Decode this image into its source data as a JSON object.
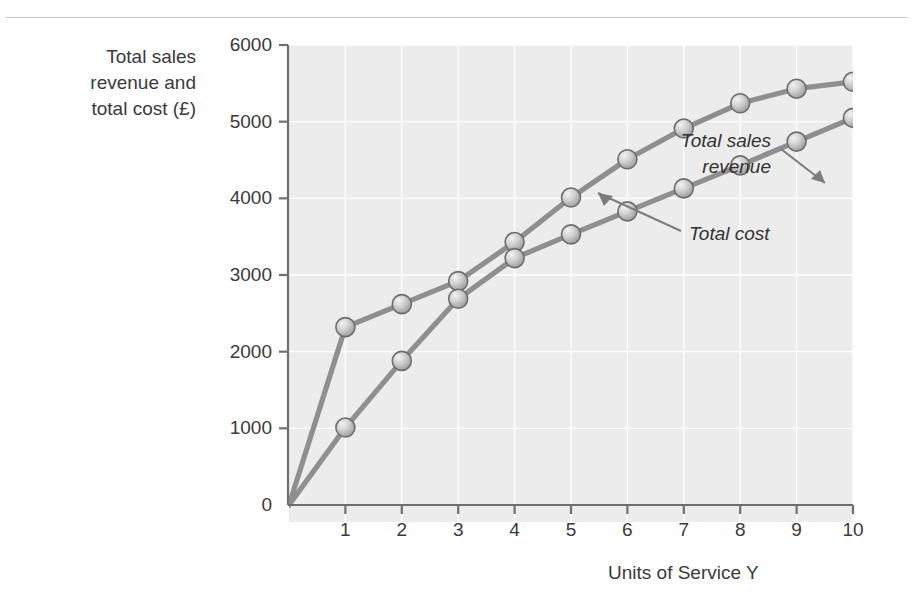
{
  "figure": {
    "y_axis_caption_lines": [
      "Total sales",
      "revenue and",
      "total cost (£)"
    ],
    "x_axis_caption": "Units of Service Y"
  },
  "chart_data": {
    "type": "line",
    "title": "",
    "xlabel": "Units of Service Y",
    "ylabel": "Total sales revenue and total cost (£)",
    "x": [
      0,
      1,
      2,
      3,
      4,
      5,
      6,
      7,
      8,
      9,
      10
    ],
    "xlim": [
      0,
      10
    ],
    "ylim": [
      0,
      6000
    ],
    "xticks": [
      1,
      2,
      3,
      4,
      5,
      6,
      7,
      8,
      9,
      10
    ],
    "xtick_labels": [
      "1",
      "2",
      "3",
      "4",
      "5",
      "6",
      "7",
      "8",
      "9",
      "10"
    ],
    "yticks": [
      0,
      1000,
      2000,
      3000,
      4000,
      5000,
      6000
    ],
    "ytick_labels": [
      "0",
      "1000",
      "2000",
      "3000",
      "4000",
      "5000",
      "6000"
    ],
    "grid": true,
    "legend": "annotations",
    "series": [
      {
        "name": "Total sales revenue",
        "color": "#8f8f8f",
        "marker": "sphere",
        "values": [
          0,
          2320,
          2620,
          2920,
          3430,
          4010,
          4510,
          4910,
          5240,
          5430,
          5520
        ]
      },
      {
        "name": "Total cost",
        "color": "#8f8f8f",
        "marker": "sphere",
        "values": [
          0,
          1010,
          1880,
          2690,
          3220,
          3530,
          3830,
          4130,
          4430,
          4740,
          5050
        ]
      }
    ],
    "annotations": [
      {
        "text": "Total sales revenue",
        "text_lines": [
          "Total sales",
          "revenue"
        ],
        "points_to_series": "Total sales revenue",
        "points_to_x": 5.5
      },
      {
        "text": "Total cost",
        "text_lines": [
          "Total cost"
        ],
        "points_to_series": "Total cost",
        "points_to_x": 6.5
      }
    ]
  },
  "colors": {
    "plot_background": "#ececec",
    "grid": "#ffffff",
    "axis": "#6f6f6f",
    "series_line": "#8f8f8f",
    "marker_fill": "#c6c6c6",
    "marker_edge": "#6d6d6d",
    "text": "#3a3a3a",
    "page_background": "#ffffff"
  }
}
